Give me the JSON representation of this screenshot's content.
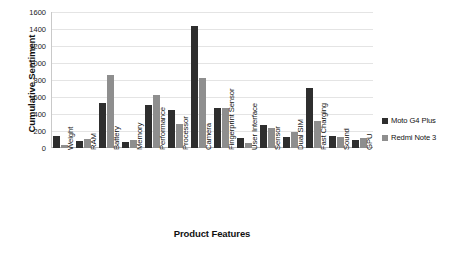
{
  "chart_data": {
    "type": "bar",
    "title": "",
    "xlabel": "Product Features",
    "ylabel": "Cumulative Sentiment",
    "ylim": [
      0,
      1600
    ],
    "ytick_step": 200,
    "yticks": [
      0,
      200,
      400,
      600,
      800,
      1000,
      1200,
      1400,
      1600
    ],
    "grid": true,
    "legend_position": "right",
    "categories": [
      "Weight",
      "RAM",
      "Battery",
      "Memory",
      "Performance",
      "Processor",
      "Camera",
      "Fingerprint Sensor",
      "User Interface",
      "Sensor",
      "Dual SIM",
      "Fast Charging",
      "Sound",
      "GPU"
    ],
    "series": [
      {
        "name": "Moto G4 Plus",
        "color": "#2e2e2e",
        "values": [
          140,
          85,
          530,
          75,
          510,
          445,
          1430,
          475,
          115,
          265,
          135,
          705,
          145,
          95
        ]
      },
      {
        "name": "Redmi Note 3",
        "color": "#8e8e8e",
        "values": [
          40,
          105,
          855,
          95,
          625,
          280,
          820,
          470,
          55,
          230,
          185,
          320,
          125,
          115
        ]
      }
    ]
  },
  "axes": {
    "y_title": "Cumulative Sentiment",
    "x_title": "Product Features"
  },
  "legend": {
    "items": [
      {
        "label": "Moto G4 Plus",
        "color": "#2e2e2e"
      },
      {
        "label": "Redmi Note 3",
        "color": "#8e8e8e"
      }
    ]
  },
  "colors": {
    "series_1": "#2e2e2e",
    "series_2": "#8e8e8e",
    "gridline": "#e4e4e4",
    "axis": "#b5b5b5",
    "background": "#ffffff"
  }
}
